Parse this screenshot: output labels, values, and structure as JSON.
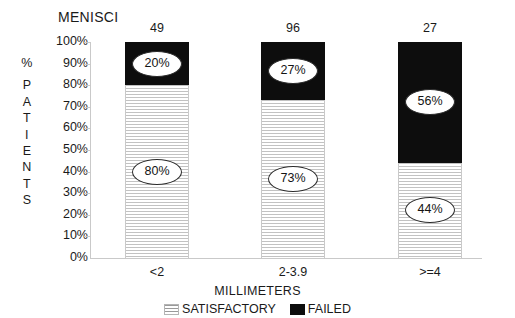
{
  "chart_data": {
    "type": "bar",
    "subtype": "stacked-percentage",
    "title": "MENISCI",
    "xlabel": "MILLIMETERS",
    "ylabel": "% PATIENTS",
    "categories": [
      "<2",
      "2-3.9",
      ">=4"
    ],
    "group_counts": [
      49,
      96,
      27
    ],
    "ylim": [
      0,
      100
    ],
    "ytick_labels": [
      "100%",
      "90%",
      "80%",
      "70%",
      "60%",
      "50%",
      "40%",
      "30%",
      "20%",
      "10%",
      "0%"
    ],
    "ytick_values": [
      100,
      90,
      80,
      70,
      60,
      50,
      40,
      30,
      20,
      10,
      0
    ],
    "grid": false,
    "legend_position": "bottom-center",
    "series": [
      {
        "name": "SATISFACTORY",
        "fill": "horizontal-hatch",
        "color": "#c2c2c2",
        "values": [
          80,
          73,
          44
        ],
        "labels": [
          "80%",
          "73%",
          "44%"
        ]
      },
      {
        "name": "FAILED",
        "fill": "solid",
        "color": "#0d0d0d",
        "values": [
          20,
          27,
          56
        ],
        "labels": [
          "20%",
          "27%",
          "56%"
        ]
      }
    ]
  },
  "y_axis_letters": [
    "%",
    "",
    "P",
    "A",
    "T",
    "I",
    "E",
    "N",
    "T",
    "S"
  ],
  "legend": {
    "items": [
      {
        "label": "SATISFACTORY",
        "swatch": "hatch-swatch-icon"
      },
      {
        "label": "FAILED",
        "swatch": "solid-black-swatch-icon"
      }
    ]
  }
}
